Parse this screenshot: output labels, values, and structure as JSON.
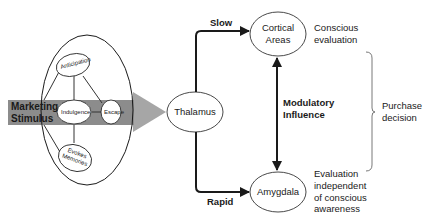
{
  "diagram": {
    "stimulus": {
      "label_line1": "Marketing",
      "label_line2": "Stimulus"
    },
    "stimulus_nodes": [
      {
        "id": "anticipation",
        "label": "Anticipation"
      },
      {
        "id": "indulgence",
        "label": "Indulgence"
      },
      {
        "id": "escape",
        "label": "Escape"
      },
      {
        "id": "evokes-memories",
        "label_line1": "Evokes",
        "label_line2": "Memories"
      }
    ],
    "thalamus": {
      "label": "Thalamus"
    },
    "cortical": {
      "label_line1": "Cortical",
      "label_line2": "Areas"
    },
    "amygdala": {
      "label": "Amygdala"
    },
    "paths": {
      "slow": "Slow",
      "rapid": "Rapid",
      "modulatory_line1": "Modulatory",
      "modulatory_line2": "Influence"
    },
    "annotations": {
      "conscious_line1": "Conscious",
      "conscious_line2": "evaluation",
      "independent_line1": "Evaluation",
      "independent_line2": "independent",
      "independent_line3": "of conscious",
      "independent_line4": "awareness",
      "purchase_line1": "Purchase",
      "purchase_line2": "decision"
    },
    "colors": {
      "band": "#8c8c8c",
      "arrow": "#a6a6a6",
      "stroke": "#1a1a1a",
      "background": "#ffffff"
    }
  }
}
